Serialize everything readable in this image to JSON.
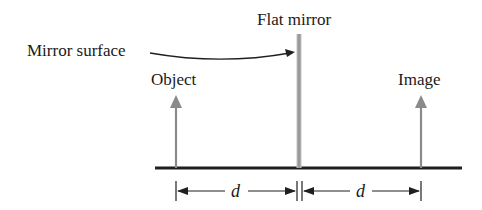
{
  "diagram": {
    "labels": {
      "flat_mirror": "Flat mirror",
      "mirror_surface": "Mirror surface",
      "object": "Object",
      "image": "Image",
      "distance_left": "d",
      "distance_right": "d"
    },
    "colors": {
      "baseline": "#1f1f1f",
      "arrow": "#8a8a8a",
      "mirror": "#a0a0a0",
      "text": "#1a1a1a"
    },
    "geometry": {
      "baseline_y": 168,
      "object_x": 176,
      "mirror_x": 299,
      "image_x": 421
    }
  }
}
